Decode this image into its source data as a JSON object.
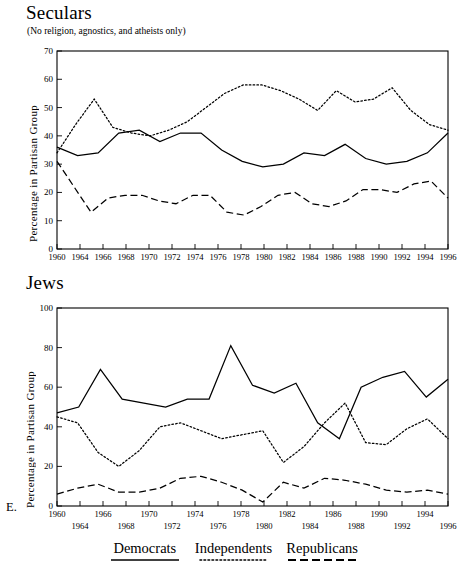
{
  "figure": {
    "panel_letter": "E.",
    "legend": [
      {
        "label": "Democrats",
        "style": "solid"
      },
      {
        "label": "Independents",
        "style": "dotted"
      },
      {
        "label": "Republicans",
        "style": "dashed"
      }
    ]
  },
  "chart_data": [
    {
      "type": "line",
      "title": "Seculars",
      "subtitle": "(No religion, agnostics, and atheists only)",
      "xlabel": "",
      "ylabel": "Percentage in Partisan Group",
      "ylim": [
        0,
        70
      ],
      "yticks": [
        0,
        10,
        20,
        30,
        40,
        50,
        60,
        70
      ],
      "xlim": [
        1960,
        1996
      ],
      "x": [
        1960,
        1962,
        1964,
        1966,
        1968,
        1970,
        1972,
        1974,
        1976,
        1978,
        1980,
        1982,
        1984,
        1986,
        1988,
        1990,
        1992,
        1994,
        1996
      ],
      "xticklabels": [
        "1960",
        "1964",
        "1966",
        "1968",
        "1970",
        "1972",
        "1974",
        "1976",
        "1978",
        "1980",
        "1982",
        "1984",
        "1986",
        "1988",
        "1990",
        "1992",
        "1994",
        "1996"
      ],
      "grid": false,
      "legend_position": "below-figure",
      "series": [
        {
          "name": "Democrats",
          "style": "solid",
          "values": [
            36,
            33,
            34,
            41,
            42,
            38,
            41,
            41,
            35,
            31,
            29,
            30,
            34,
            33,
            37,
            32,
            30,
            31,
            34,
            41
          ]
        },
        {
          "name": "Independents",
          "style": "dotted",
          "values": [
            34,
            44,
            53,
            43,
            41,
            40,
            42,
            45,
            50,
            55,
            58,
            58,
            56,
            53,
            49,
            56,
            52,
            53,
            57,
            49,
            44,
            42
          ]
        },
        {
          "name": "Republicans",
          "style": "dashed",
          "values": [
            31,
            22,
            13,
            18,
            19,
            19,
            17,
            16,
            19,
            19,
            13,
            12,
            15,
            19,
            20,
            16,
            15,
            17,
            21,
            21,
            20,
            23,
            24,
            18
          ]
        }
      ]
    },
    {
      "type": "line",
      "title": "Jews",
      "subtitle": "",
      "xlabel": "",
      "ylabel": "Percentage in Partisan Group",
      "ylim": [
        0,
        100
      ],
      "yticks": [
        0,
        20,
        40,
        60,
        80,
        100
      ],
      "xlim": [
        1960,
        1996
      ],
      "xticklabels_top": [
        "1960",
        "1966",
        "1970",
        "1974",
        "1978",
        "1982",
        "1986",
        "1990",
        "1994"
      ],
      "xticklabels_bottom": [
        "1964",
        "1968",
        "1972",
        "1976",
        "1980",
        "1984",
        "1988",
        "1992",
        "1996"
      ],
      "grid": false,
      "legend_position": "below-figure",
      "series": [
        {
          "name": "Democrats",
          "style": "solid",
          "values": [
            47,
            50,
            69,
            54,
            52,
            50,
            54,
            54,
            81,
            61,
            57,
            62,
            42,
            34,
            60,
            65,
            68,
            55,
            64
          ]
        },
        {
          "name": "Independents",
          "style": "dotted",
          "values": [
            45,
            42,
            27,
            20,
            28,
            40,
            42,
            38,
            34,
            36,
            38,
            22,
            30,
            42,
            52,
            32,
            31,
            39,
            44,
            34
          ]
        },
        {
          "name": "Republicans",
          "style": "dashed",
          "values": [
            6,
            9,
            11,
            7,
            7,
            9,
            14,
            15,
            12,
            8,
            2,
            12,
            9,
            14,
            13,
            11,
            8,
            7,
            8,
            6
          ]
        }
      ]
    }
  ]
}
